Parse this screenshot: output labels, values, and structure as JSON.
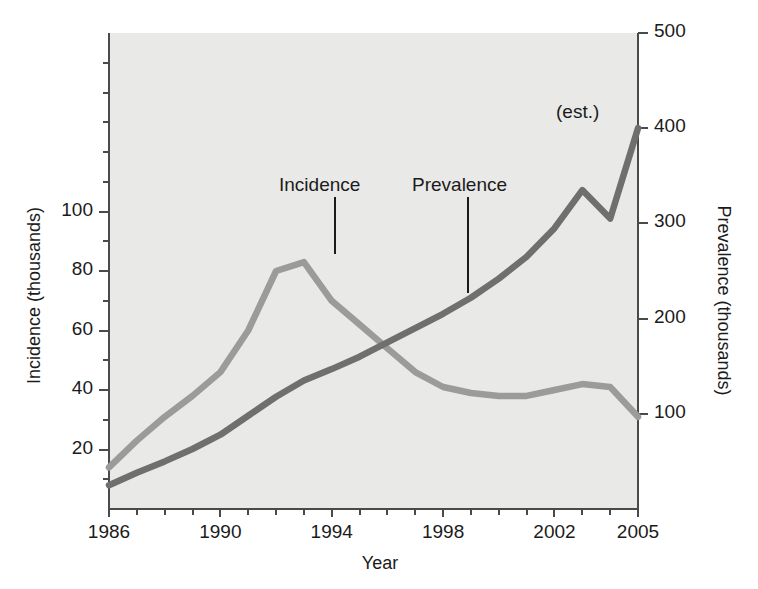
{
  "chart_data": {
    "type": "line",
    "title": "",
    "xlabel": "Year",
    "ylabel": "Incidence (thousands)",
    "y2label": "Prevalence (thousands)",
    "grid": false,
    "legend_position": "inline-annotation",
    "xlim": [
      1986,
      2005
    ],
    "ylim": [
      0,
      160
    ],
    "y2lim": [
      0,
      500
    ],
    "x": [
      1986,
      1987,
      1988,
      1989,
      1990,
      1991,
      1992,
      1993,
      1994,
      1995,
      1996,
      1997,
      1998,
      1999,
      2000,
      2001,
      2002,
      2003,
      2004,
      2005
    ],
    "x_tick_labels": [
      "1986",
      "1990",
      "1994",
      "1998",
      "2002",
      "2005"
    ],
    "x_tick_values": [
      1986,
      1990,
      1994,
      1998,
      2002,
      2005
    ],
    "y_tick_labels": [
      "20",
      "40",
      "60",
      "80",
      "100"
    ],
    "y_tick_values": [
      20,
      40,
      60,
      80,
      100
    ],
    "y_minor_tick_values": [
      10,
      30,
      50,
      70,
      90,
      110,
      120,
      130,
      140,
      150
    ],
    "y2_tick_labels": [
      "100",
      "200",
      "300",
      "400",
      "500"
    ],
    "y2_tick_values": [
      100,
      200,
      300,
      400,
      500
    ],
    "series": [
      {
        "name": "Incidence",
        "axis": "left",
        "unit": "thousands",
        "color": "#9b9b99",
        "values": [
          14,
          23,
          31,
          38,
          46,
          60,
          80,
          83,
          70,
          62,
          54,
          46,
          41,
          39,
          38,
          38,
          40,
          42,
          41,
          31
        ]
      },
      {
        "name": "Prevalence",
        "axis": "right",
        "unit": "thousands",
        "color": "#6f6f6d",
        "values": [
          25,
          38,
          50,
          63,
          78,
          98,
          118,
          135,
          147,
          160,
          175,
          190,
          205,
          222,
          242,
          265,
          295,
          335,
          305,
          400
        ]
      }
    ],
    "annotations": [
      {
        "text": "Incidence",
        "points_to_year": 1993.5,
        "points_to_value": 80
      },
      {
        "text": "Prevalence",
        "points_to_year": 1999.3,
        "points_to_value": 228
      },
      {
        "text": "(est.)",
        "points_to_year": 2005,
        "points_to_value": 400
      }
    ]
  },
  "colors": {
    "plot_background": "#e9e9e7",
    "axis": "#4a4a4a",
    "text": "#1b1b1b",
    "incidence_line": "#9b9b99",
    "prevalence_line": "#6f6f6d"
  }
}
